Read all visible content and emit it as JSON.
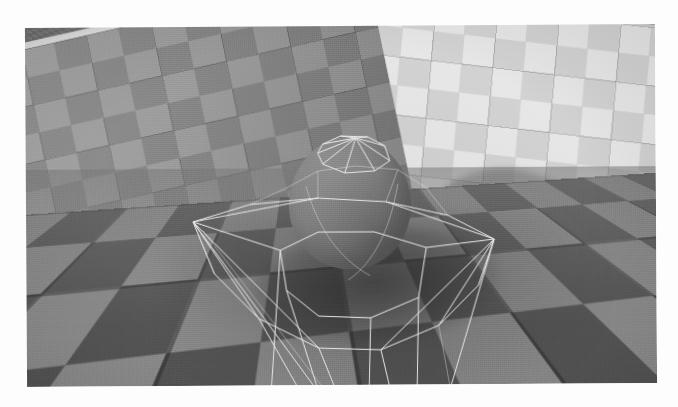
{
  "figure": {
    "kind": "3d-render",
    "caption": "",
    "alt_text": "Wireframe-caged sphere on a checkerboard floor between two checkerboard walls",
    "page_background": "#fdfdfd",
    "margin_px": 26
  },
  "render": {
    "viewport": {
      "x": 26,
      "y": 26,
      "width": 630,
      "height": 359
    },
    "color_mode": "grayscale",
    "has_film_grain": true,
    "rotation_deg": -0.35
  },
  "scene": {
    "objects": [
      {
        "id": "sphere",
        "label": "Sphere",
        "shading": "diffuse-gray",
        "color": "#787878"
      },
      {
        "id": "wireframe",
        "label": "Polyhedral Wireframe",
        "shading": "line-overlay",
        "color": "#e9e9e9"
      },
      {
        "id": "floor",
        "label": "Checkerboard Floor",
        "shading": "checker",
        "color": "#8e8e8e"
      },
      {
        "id": "left-wall",
        "label": "Left Wall",
        "shading": "checker",
        "color": "#8b8b8b"
      },
      {
        "id": "right-wall",
        "label": "Right Wall",
        "shading": "checker",
        "color": "#d6d6d6"
      },
      {
        "id": "far-floor",
        "label": "Distant Floor",
        "shading": "fine-checker",
        "color": "#5d5d5d"
      },
      {
        "id": "wall-cap",
        "label": "Wall Top Rail",
        "shading": "flat-bright",
        "color": "#ebebeb"
      },
      {
        "id": "wall-shadow",
        "label": "Sphere Shadow on Wall",
        "shading": "soft-shadow",
        "color": "#3c3c3c"
      },
      {
        "id": "floor-shadow",
        "label": "Contact Shadow",
        "shading": "soft-shadow",
        "color": "#2a2a2a"
      }
    ]
  },
  "palette": {
    "page": "#fdfdfd",
    "sphere_light": "#8d8d8d",
    "sphere_mid": "#787878",
    "sphere_dark": "#5e5e5e",
    "wire_line": "#e9e9e9",
    "floor_dark_tile": "#565656",
    "floor_light_tile": "#8e8e8e",
    "left_wall_dark_tile": "#8b8b8b",
    "left_wall_light_tile": "#a2a2a2",
    "right_wall_dark_tile": "#d6d6d6",
    "right_wall_light_tile": "#ececec",
    "far_floor_dark": "#5d5d5d",
    "far_floor_light": "#787878",
    "wall_cap": "#ebebeb",
    "shadow": "#2a2a2a"
  }
}
